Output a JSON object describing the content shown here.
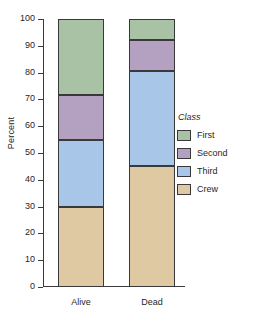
{
  "chart_data": {
    "type": "bar",
    "stacked": true,
    "stacked_mode": "percent",
    "title": "",
    "xlabel": "",
    "ylabel": "Percent",
    "ylim": [
      0,
      100
    ],
    "yticks": [
      0,
      10,
      20,
      30,
      40,
      50,
      60,
      70,
      80,
      90,
      100
    ],
    "ytick_labels": [
      "0",
      "10",
      "20",
      "30",
      "40",
      "50",
      "60",
      "70",
      "80",
      "90",
      "100"
    ],
    "grid": false,
    "categories": [
      "Alive",
      "Dead"
    ],
    "legend_title": "Class",
    "legend_position": "right",
    "series": [
      {
        "name": "First",
        "color": "#a9c2a5",
        "values": [
          28.5,
          8.0
        ]
      },
      {
        "name": "Second",
        "color": "#b4a0c0",
        "values": [
          16.5,
          11.5
        ]
      },
      {
        "name": "Third",
        "color": "#a8c6e8",
        "values": [
          25.0,
          35.5
        ]
      },
      {
        "name": "Crew",
        "color": "#dfc9a3",
        "values": [
          30.0,
          45.0
        ]
      }
    ],
    "stack_boundaries": {
      "Alive": [
        0,
        30.0,
        55.0,
        71.5,
        100
      ],
      "Dead": [
        0,
        45.0,
        80.5,
        92.0,
        100
      ]
    },
    "axis_color": "#3a3a3a",
    "segment_border_color": "#39393c",
    "background": "#ffffff"
  }
}
